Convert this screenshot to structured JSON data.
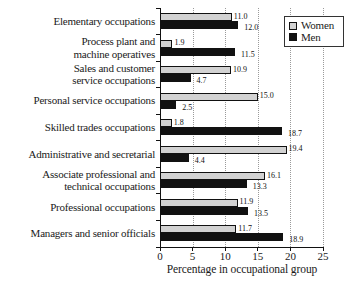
{
  "legend": {
    "items": [
      {
        "label": "Women",
        "swatch_color": "#d2d2d2"
      },
      {
        "label": "Men",
        "swatch_color": "#111111"
      }
    ]
  },
  "chart_data": {
    "type": "bar",
    "orientation": "horizontal",
    "title": "",
    "xlabel": "Percentage in occupational group",
    "ylabel": "",
    "xlim": [
      0,
      25
    ],
    "xticks": [
      0,
      5,
      10,
      15,
      20,
      25
    ],
    "grid": {
      "vertical": true,
      "style": "dotted",
      "at": [
        5,
        10,
        15,
        20,
        25
      ]
    },
    "legend_position": "top-right",
    "categories": [
      "Elementary occupations",
      "Process plant and machine operatives",
      "Sales and customer service occupations",
      "Personal service occupations",
      "Skilled trades occupations",
      "Administrative and secretarial",
      "Associate professional and technical occupations",
      "Professional occupations",
      "Managers and senior officials"
    ],
    "category_label_lines": [
      [
        "Elementary occupations"
      ],
      [
        "Process plant and",
        "machine operatives"
      ],
      [
        "Sales and customer",
        "service occupations"
      ],
      [
        "Personal service occupations"
      ],
      [
        "Skilled trades occupations"
      ],
      [
        "Administrative and secretarial"
      ],
      [
        "Associate professional and",
        "technical occupations"
      ],
      [
        "Professional occupations"
      ],
      [
        "Managers and senior officials"
      ]
    ],
    "series": [
      {
        "name": "Women",
        "color": "#d2d2d2",
        "border_color": "#111111",
        "values": [
          11.0,
          1.9,
          10.9,
          15.0,
          1.8,
          19.4,
          16.1,
          11.9,
          11.7
        ]
      },
      {
        "name": "Men",
        "color": "#111111",
        "border_color": "#111111",
        "values": [
          12.0,
          11.5,
          4.7,
          2.5,
          18.7,
          4.4,
          13.3,
          13.5,
          18.9
        ]
      }
    ],
    "value_label_decimals": 1
  }
}
